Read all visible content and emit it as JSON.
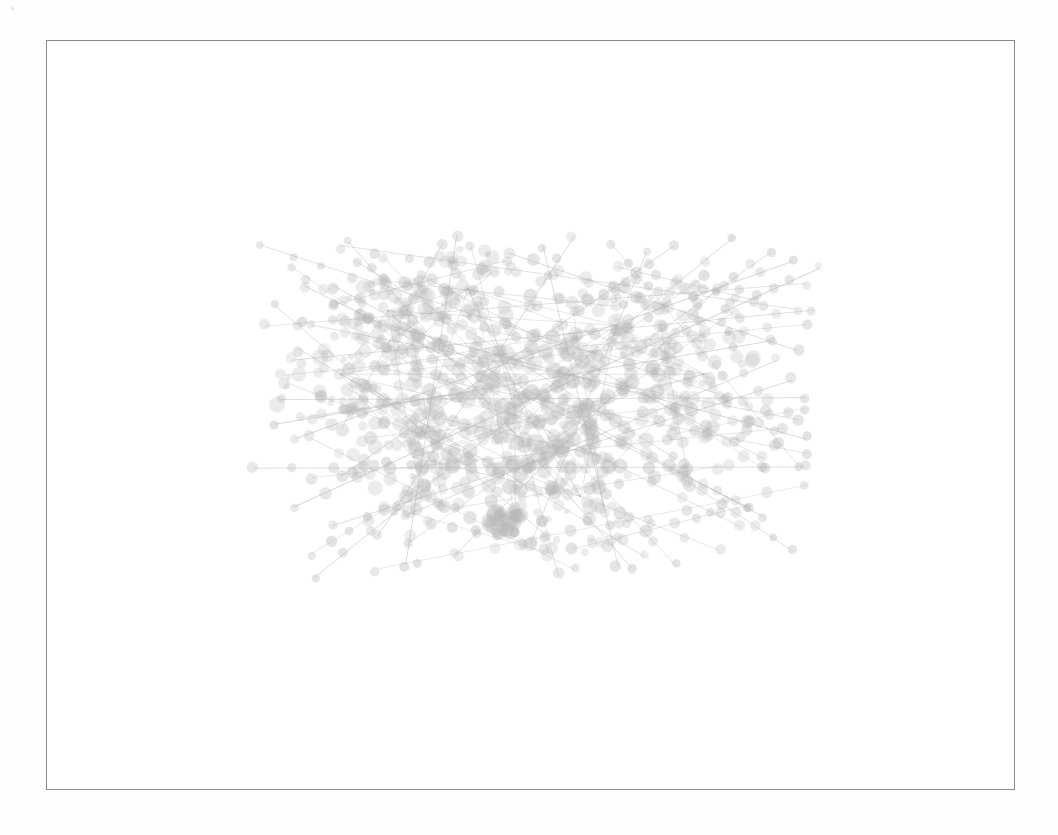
{
  "document": {
    "title": "Network graph figure",
    "background_color": "#fefefe"
  },
  "figure": {
    "name": "node-link-network-diagram",
    "frame": {
      "x": 46,
      "y": 40,
      "width": 969,
      "height": 750,
      "border_color": "#8a8a8a",
      "border_width": 1,
      "fill_color": "#ffffff"
    },
    "caption": "",
    "label": ""
  },
  "chart_data": {
    "type": "scatter",
    "subtype": "node-link-graph",
    "title": "",
    "subtitle": "",
    "xlabel": "",
    "ylabel": "",
    "legend": [],
    "annotations": [],
    "grid": false,
    "axes_visible": false,
    "tick_labels": [],
    "style": {
      "node_color": "#b4b4b4",
      "node_opacity": 0.3,
      "edge_color": "#9a9a9a",
      "edge_opacity": 0.32,
      "edge_width": 1.0,
      "background": "#ffffff",
      "rendering": "faint grayscale, heavily overlapping, scanned print appearance"
    },
    "content_bounds": {
      "x_min": 165,
      "x_max": 892,
      "y_min": 163,
      "y_max": 652
    },
    "counts": {
      "nodes": 240,
      "edges": 64,
      "chains": 64
    },
    "node_radius_range": [
      3,
      9
    ],
    "hub_centers": [
      {
        "x": 0.305,
        "y": 0.3
      },
      {
        "x": 0.415,
        "y": 0.255
      },
      {
        "x": 0.62,
        "y": 0.33
      },
      {
        "x": 0.5,
        "y": 0.52
      },
      {
        "x": 0.74,
        "y": 0.43
      },
      {
        "x": 0.34,
        "y": 0.6
      },
      {
        "x": 0.57,
        "y": 0.68
      },
      {
        "x": 0.24,
        "y": 0.43
      }
    ],
    "chains": [
      {
        "x1": 0.132,
        "y1": 0.168,
        "x2": 0.76,
        "y2": 0.47,
        "n": 15,
        "w": 1.0
      },
      {
        "x1": 0.138,
        "y1": 0.33,
        "x2": 0.88,
        "y2": 0.245,
        "n": 16,
        "w": 1.1
      },
      {
        "x1": 0.15,
        "y1": 0.53,
        "x2": 0.83,
        "y2": 0.36,
        "n": 14,
        "w": 1.0
      },
      {
        "x1": 0.175,
        "y1": 0.7,
        "x2": 0.9,
        "y2": 0.21,
        "n": 17,
        "w": 1.1
      },
      {
        "x1": 0.205,
        "y1": 0.845,
        "x2": 0.78,
        "y2": 0.15,
        "n": 15,
        "w": 1.0
      },
      {
        "x1": 0.12,
        "y1": 0.62,
        "x2": 0.88,
        "y2": 0.62,
        "n": 14,
        "w": 0.9
      },
      {
        "x1": 0.25,
        "y1": 0.16,
        "x2": 0.64,
        "y2": 0.83,
        "n": 13,
        "w": 1.0
      },
      {
        "x1": 0.4,
        "y1": 0.145,
        "x2": 0.33,
        "y2": 0.82,
        "n": 12,
        "w": 0.9
      },
      {
        "x1": 0.56,
        "y1": 0.15,
        "x2": 0.29,
        "y2": 0.76,
        "n": 13,
        "w": 1.0
      },
      {
        "x1": 0.7,
        "y1": 0.17,
        "x2": 0.24,
        "y2": 0.64,
        "n": 14,
        "w": 1.0
      },
      {
        "x1": 0.86,
        "y1": 0.2,
        "x2": 0.18,
        "y2": 0.56,
        "n": 15,
        "w": 1.1
      },
      {
        "x1": 0.88,
        "y1": 0.33,
        "x2": 0.16,
        "y2": 0.43,
        "n": 14,
        "w": 0.9
      },
      {
        "x1": 0.87,
        "y1": 0.52,
        "x2": 0.2,
        "y2": 0.33,
        "n": 14,
        "w": 1.0
      },
      {
        "x1": 0.82,
        "y1": 0.72,
        "x2": 0.23,
        "y2": 0.25,
        "n": 15,
        "w": 1.0
      },
      {
        "x1": 0.7,
        "y1": 0.82,
        "x2": 0.3,
        "y2": 0.19,
        "n": 13,
        "w": 0.9
      },
      {
        "x1": 0.54,
        "y1": 0.84,
        "x2": 0.42,
        "y2": 0.17,
        "n": 12,
        "w": 0.9
      },
      {
        "x1": 0.3,
        "y1": 0.33,
        "x2": 0.88,
        "y2": 0.56,
        "n": 14,
        "w": 1.0
      },
      {
        "x1": 0.19,
        "y1": 0.25,
        "x2": 0.8,
        "y2": 0.7,
        "n": 14,
        "w": 1.0
      },
      {
        "x1": 0.165,
        "y1": 0.45,
        "x2": 0.76,
        "y2": 0.79,
        "n": 13,
        "w": 0.9
      },
      {
        "x1": 0.23,
        "y1": 0.74,
        "x2": 0.86,
        "y2": 0.44,
        "n": 14,
        "w": 1.0
      },
      {
        "x1": 0.26,
        "y1": 0.2,
        "x2": 0.7,
        "y2": 0.6,
        "n": 11,
        "w": 0.9
      },
      {
        "x1": 0.35,
        "y1": 0.23,
        "x2": 0.82,
        "y2": 0.6,
        "n": 12,
        "w": 0.9
      },
      {
        "x1": 0.18,
        "y1": 0.38,
        "x2": 0.66,
        "y2": 0.8,
        "n": 12,
        "w": 0.9
      },
      {
        "x1": 0.47,
        "y1": 0.18,
        "x2": 0.87,
        "y2": 0.38,
        "n": 11,
        "w": 0.9
      },
      {
        "x1": 0.61,
        "y1": 0.16,
        "x2": 0.87,
        "y2": 0.62,
        "n": 10,
        "w": 0.8
      },
      {
        "x1": 0.2,
        "y1": 0.56,
        "x2": 0.56,
        "y2": 0.83,
        "n": 10,
        "w": 0.8
      },
      {
        "x1": 0.33,
        "y1": 0.78,
        "x2": 0.78,
        "y2": 0.3,
        "n": 12,
        "w": 0.9
      },
      {
        "x1": 0.15,
        "y1": 0.29,
        "x2": 0.52,
        "y2": 0.76,
        "n": 11,
        "w": 0.9
      },
      {
        "x1": 0.24,
        "y1": 0.17,
        "x2": 0.87,
        "y2": 0.3,
        "n": 13,
        "w": 1.0
      },
      {
        "x1": 0.17,
        "y1": 0.4,
        "x2": 0.89,
        "y2": 0.3,
        "n": 14,
        "w": 0.9
      },
      {
        "x1": 0.16,
        "y1": 0.48,
        "x2": 0.88,
        "y2": 0.48,
        "n": 13,
        "w": 0.9
      },
      {
        "x1": 0.2,
        "y1": 0.64,
        "x2": 0.85,
        "y2": 0.54,
        "n": 12,
        "w": 0.9
      },
      {
        "x1": 0.29,
        "y1": 0.83,
        "x2": 0.88,
        "y2": 0.66,
        "n": 11,
        "w": 0.8
      },
      {
        "x1": 0.38,
        "y1": 0.16,
        "x2": 0.24,
        "y2": 0.54,
        "n": 9,
        "w": 0.8
      },
      {
        "x1": 0.52,
        "y1": 0.17,
        "x2": 0.62,
        "y2": 0.82,
        "n": 12,
        "w": 0.9
      },
      {
        "x1": 0.66,
        "y1": 0.18,
        "x2": 0.5,
        "y2": 0.78,
        "n": 11,
        "w": 0.9
      },
      {
        "x1": 0.76,
        "y1": 0.25,
        "x2": 0.4,
        "y2": 0.8,
        "n": 12,
        "w": 0.9
      },
      {
        "x1": 0.84,
        "y1": 0.4,
        "x2": 0.33,
        "y2": 0.72,
        "n": 12,
        "w": 0.9
      },
      {
        "x1": 0.88,
        "y1": 0.59,
        "x2": 0.3,
        "y2": 0.42,
        "n": 13,
        "w": 0.9
      },
      {
        "x1": 0.79,
        "y1": 0.74,
        "x2": 0.26,
        "y2": 0.35,
        "n": 13,
        "w": 0.9
      },
      {
        "x1": 0.3,
        "y1": 0.24,
        "x2": 0.62,
        "y2": 0.29,
        "n": 8,
        "w": 0.8
      },
      {
        "x1": 0.35,
        "y1": 0.42,
        "x2": 0.74,
        "y2": 0.36,
        "n": 9,
        "w": 0.8
      },
      {
        "x1": 0.28,
        "y1": 0.56,
        "x2": 0.7,
        "y2": 0.5,
        "n": 9,
        "w": 0.8
      },
      {
        "x1": 0.4,
        "y1": 0.7,
        "x2": 0.76,
        "y2": 0.62,
        "n": 8,
        "w": 0.8
      },
      {
        "x1": 0.43,
        "y1": 0.28,
        "x2": 0.48,
        "y2": 0.72,
        "n": 8,
        "w": 0.8
      },
      {
        "x1": 0.56,
        "y1": 0.3,
        "x2": 0.6,
        "y2": 0.7,
        "n": 8,
        "w": 0.8
      },
      {
        "x1": 0.33,
        "y1": 0.3,
        "x2": 0.38,
        "y2": 0.7,
        "n": 8,
        "w": 0.8
      },
      {
        "x1": 0.68,
        "y1": 0.33,
        "x2": 0.72,
        "y2": 0.66,
        "n": 7,
        "w": 0.8
      },
      {
        "x1": 0.23,
        "y1": 0.29,
        "x2": 0.47,
        "y2": 0.2,
        "n": 7,
        "w": 0.8
      },
      {
        "x1": 0.62,
        "y1": 0.21,
        "x2": 0.81,
        "y2": 0.28,
        "n": 7,
        "w": 0.8
      },
      {
        "x1": 0.185,
        "y1": 0.52,
        "x2": 0.4,
        "y2": 0.47,
        "n": 7,
        "w": 0.8
      },
      {
        "x1": 0.7,
        "y1": 0.55,
        "x2": 0.88,
        "y2": 0.5,
        "n": 7,
        "w": 0.8
      },
      {
        "x1": 0.3,
        "y1": 0.7,
        "x2": 0.52,
        "y2": 0.79,
        "n": 7,
        "w": 0.8
      },
      {
        "x1": 0.56,
        "y1": 0.79,
        "x2": 0.8,
        "y2": 0.7,
        "n": 7,
        "w": 0.8
      },
      {
        "x1": 0.45,
        "y1": 0.22,
        "x2": 0.3,
        "y2": 0.42,
        "n": 6,
        "w": 0.8
      },
      {
        "x1": 0.74,
        "y1": 0.23,
        "x2": 0.56,
        "y2": 0.42,
        "n": 7,
        "w": 0.8
      },
      {
        "x1": 0.25,
        "y1": 0.46,
        "x2": 0.42,
        "y2": 0.62,
        "n": 7,
        "w": 0.8
      },
      {
        "x1": 0.64,
        "y1": 0.45,
        "x2": 0.82,
        "y2": 0.62,
        "n": 7,
        "w": 0.8
      },
      {
        "x1": 0.38,
        "y1": 0.52,
        "x2": 0.6,
        "y2": 0.6,
        "n": 7,
        "w": 0.8
      },
      {
        "x1": 0.48,
        "y1": 0.44,
        "x2": 0.48,
        "y2": 0.7,
        "n": 6,
        "w": 0.8
      },
      {
        "x1": 0.17,
        "y1": 0.21,
        "x2": 0.34,
        "y2": 0.38,
        "n": 7,
        "w": 0.8
      },
      {
        "x1": 0.83,
        "y1": 0.18,
        "x2": 0.66,
        "y2": 0.36,
        "n": 7,
        "w": 0.8
      },
      {
        "x1": 0.2,
        "y1": 0.8,
        "x2": 0.38,
        "y2": 0.63,
        "n": 7,
        "w": 0.8
      },
      {
        "x1": 0.86,
        "y1": 0.79,
        "x2": 0.69,
        "y2": 0.62,
        "n": 7,
        "w": 0.8
      }
    ]
  },
  "artifacts": {
    "speck_label": "scan-speck"
  }
}
